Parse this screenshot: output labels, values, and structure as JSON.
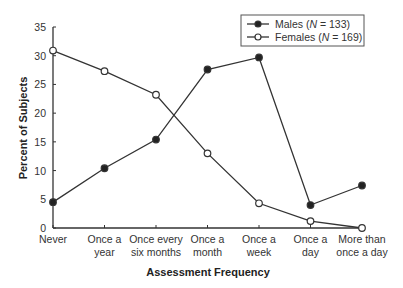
{
  "chart_data": {
    "type": "line",
    "title": "",
    "xlabel": "Assessment Frequency",
    "ylabel": "Percent of Subjects",
    "ylim": [
      0,
      35
    ],
    "yticks": [
      0,
      5,
      10,
      15,
      20,
      25,
      30,
      35
    ],
    "grid": false,
    "legend_position": "upper right",
    "categories": [
      [
        "Never"
      ],
      [
        "Once a",
        "year"
      ],
      [
        "Once every",
        "six months"
      ],
      [
        "Once a",
        "month"
      ],
      [
        "Once a",
        "week"
      ],
      [
        "Once a",
        "day"
      ],
      [
        "More than",
        "once a day"
      ]
    ],
    "series": [
      {
        "name": "Males",
        "n": "133",
        "marker": "filled-circle",
        "values": [
          4.5,
          10.4,
          15.4,
          27.6,
          29.7,
          4.0,
          7.4
        ]
      },
      {
        "name": "Females",
        "n": "169",
        "marker": "open-circle",
        "values": [
          30.9,
          27.3,
          23.2,
          13.0,
          4.3,
          1.2,
          0.0
        ]
      }
    ]
  },
  "colors": {
    "line": "#333333",
    "background": "#ffffff"
  }
}
